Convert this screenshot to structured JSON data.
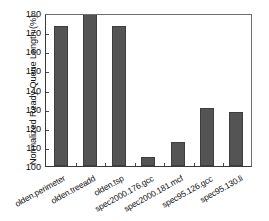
{
  "chart_data": {
    "type": "bar",
    "title": "",
    "xlabel": "",
    "ylabel": "Normalized Ready Queue Length (%)",
    "categories": [
      "olden.perimeter",
      "olden.treeadd",
      "olden.tsp",
      "spec2000.176.gcc",
      "spec2000.181.mcf",
      "spec95.126.gcc",
      "spec95.130.li"
    ],
    "values": [
      173.0,
      179.5,
      173.3,
      104.5,
      112.5,
      130.5,
      128.5
    ],
    "ylim": [
      100,
      180
    ],
    "yticks": [
      100,
      110,
      120,
      130,
      140,
      150,
      160,
      170,
      180
    ],
    "ytick_labels": [
      "100",
      "110",
      "120",
      "130",
      "140",
      "150",
      "160",
      "170",
      "180"
    ],
    "grid": false,
    "legend": null,
    "bar_color": "#545454",
    "axis_color": "#3a3a3a",
    "background": "#ffffff"
  }
}
